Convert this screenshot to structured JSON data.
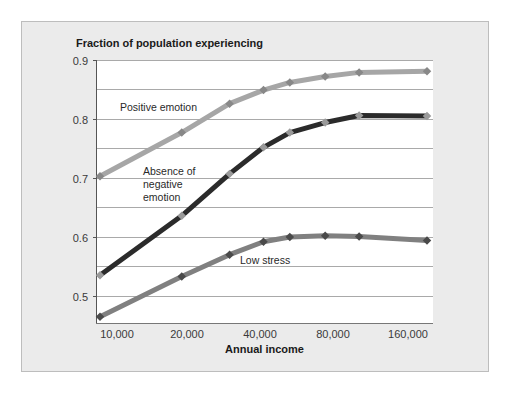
{
  "chart_data": {
    "type": "line",
    "title": "",
    "ylabel": "Fraction of population experiencing",
    "xlabel": "Annual income",
    "x_scale": "log",
    "x_tick_labels": [
      "10,000",
      "20,000",
      "40,000",
      "80,000",
      "160,000"
    ],
    "y_tick_labels": [
      "0.9",
      "0.8",
      "0.7",
      "0.6",
      "0.5"
    ],
    "ylim": [
      0.455,
      0.9
    ],
    "grid": true,
    "legend": "inline annotations",
    "x": [
      10000,
      20000,
      30000,
      40000,
      50000,
      67500,
      90000,
      160000
    ],
    "series": [
      {
        "name": "Positive emotion",
        "color": "#a6a6a6",
        "values": [
          0.703,
          0.777,
          0.826,
          0.849,
          0.862,
          0.872,
          0.879,
          0.881
        ]
      },
      {
        "name": "Absence of negative emotion",
        "color": "#2b2b2b",
        "values": [
          0.535,
          0.636,
          0.707,
          0.752,
          0.777,
          0.794,
          0.806,
          0.805
        ]
      },
      {
        "name": "Low stress",
        "color": "#808080",
        "values": [
          0.465,
          0.533,
          0.57,
          0.592,
          0.6,
          0.602,
          0.601,
          0.594
        ]
      }
    ],
    "annotations": [
      {
        "text": "Positive emotion"
      },
      {
        "text": "Absence of"
      },
      {
        "text": "negative"
      },
      {
        "text": "emotion"
      },
      {
        "text": "Low stress"
      }
    ]
  },
  "labels": {
    "y_axis_title": "Fraction of population experiencing",
    "x_axis_title": "Annual income",
    "positive": "Positive emotion",
    "absence_1": "Absence of",
    "absence_2": "negative",
    "absence_3": "emotion",
    "low_stress": "Low stress",
    "yticks": [
      "0.9",
      "0.8",
      "0.7",
      "0.6",
      "0.5"
    ],
    "xticks": [
      "10,000",
      "20,000",
      "40,000",
      "80,000",
      "160,000"
    ]
  }
}
